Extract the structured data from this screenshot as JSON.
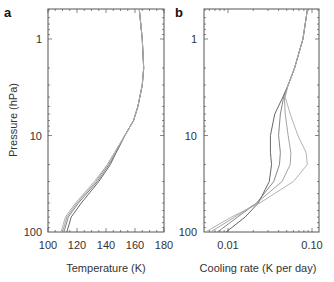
{
  "chart_data": [
    {
      "panel": "a",
      "type": "line",
      "title": "",
      "xlabel": "Temperature (K)",
      "ylabel": "Pressure (hPa)",
      "xlim": [
        100,
        180
      ],
      "ylim": [
        100,
        0.5
      ],
      "yscale": "log",
      "xticks": [
        "100",
        "120",
        "140",
        "160",
        "180"
      ],
      "yticks": [
        "1",
        "10",
        "100"
      ],
      "grid": false,
      "legend": null,
      "series": [
        {
          "name": "profile 1",
          "pressure": [
            0.5,
            1,
            2,
            3,
            5,
            7,
            10,
            15,
            20,
            30,
            50,
            70,
            100
          ],
          "values": [
            163,
            165,
            166,
            165,
            162,
            159,
            153,
            147,
            143,
            135,
            123,
            116,
            113
          ]
        },
        {
          "name": "profile 2",
          "pressure": [
            0.5,
            1,
            2,
            3,
            5,
            7,
            10,
            15,
            20,
            30,
            50,
            70,
            100
          ],
          "values": [
            163,
            165,
            166,
            165,
            162,
            159,
            153,
            147,
            142,
            134,
            121,
            114,
            111
          ]
        },
        {
          "name": "profile 3",
          "pressure": [
            0.5,
            1,
            2,
            3,
            5,
            7,
            10,
            15,
            20,
            30,
            50,
            70,
            100
          ],
          "values": [
            163,
            165,
            166,
            165,
            162,
            159,
            153,
            146,
            141,
            133,
            120,
            113,
            110
          ]
        },
        {
          "name": "profile 4",
          "pressure": [
            0.5,
            1,
            2,
            3,
            5,
            7,
            10,
            15,
            20,
            30,
            50,
            70,
            100
          ],
          "values": [
            163,
            165,
            166,
            165,
            162,
            159,
            153,
            146,
            141,
            132,
            119,
            112,
            109
          ]
        }
      ]
    },
    {
      "panel": "b",
      "type": "line",
      "title": "",
      "xlabel": "Cooling rate (K per day)",
      "ylabel": "",
      "xlim": [
        0.005,
        0.12
      ],
      "xscale": "log",
      "ylim": [
        100,
        0.5
      ],
      "yscale": "log",
      "xticks": [
        "0.01",
        "0.10"
      ],
      "yticks": [
        "1",
        "10",
        "100"
      ],
      "grid": false,
      "legend": null,
      "series": [
        {
          "name": "case 1",
          "pressure": [
            0.5,
            1,
            2,
            3,
            4,
            6,
            10,
            15,
            20,
            30,
            50,
            70,
            100
          ],
          "values": [
            0.088,
            0.078,
            0.062,
            0.052,
            0.045,
            0.036,
            0.032,
            0.032,
            0.033,
            0.031,
            0.023,
            0.016,
            0.0095
          ]
        },
        {
          "name": "case 2",
          "pressure": [
            0.5,
            1,
            2,
            3,
            4,
            6,
            10,
            15,
            20,
            30,
            50,
            70,
            100
          ],
          "values": [
            0.088,
            0.078,
            0.062,
            0.052,
            0.046,
            0.042,
            0.04,
            0.042,
            0.041,
            0.035,
            0.022,
            0.013,
            0.0075
          ]
        },
        {
          "name": "case 3",
          "pressure": [
            0.5,
            1,
            2,
            3,
            4,
            6,
            10,
            15,
            20,
            30,
            50,
            70,
            100
          ],
          "values": [
            0.088,
            0.078,
            0.062,
            0.052,
            0.047,
            0.048,
            0.052,
            0.056,
            0.055,
            0.044,
            0.022,
            0.012,
            0.0062
          ]
        },
        {
          "name": "case 4",
          "pressure": [
            0.5,
            1,
            2,
            3,
            4,
            6,
            10,
            15,
            20,
            30,
            50,
            70,
            100
          ],
          "values": [
            0.088,
            0.078,
            0.062,
            0.052,
            0.048,
            0.055,
            0.068,
            0.085,
            0.088,
            0.06,
            0.024,
            0.011,
            0.0054
          ]
        }
      ]
    }
  ],
  "panels": {
    "a": {
      "letter": "a",
      "xlabel": "Temperature (K)",
      "ylabel": "Pressure (hPa)",
      "xticks": [
        "100",
        "120",
        "140",
        "160",
        "180"
      ],
      "yticks": [
        "1",
        "10",
        "100"
      ]
    },
    "b": {
      "letter": "b",
      "xlabel": "Cooling rate (K per day)",
      "xticks": [
        "0.01",
        "0.10"
      ],
      "yticks": [
        "1",
        "10",
        "100"
      ]
    }
  }
}
